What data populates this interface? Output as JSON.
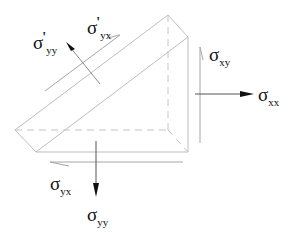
{
  "diagram": {
    "type": "stress-element-wedge",
    "colors": {
      "edge": "#bdbdbd",
      "arrow": "#222222",
      "shear": "#9e9e9e",
      "text": "#111111",
      "background": "#ffffff"
    },
    "labels": {
      "sigma_yy_prime": {
        "symbol": "σ",
        "prime": "'",
        "subscript": "yy"
      },
      "sigma_yx_prime": {
        "symbol": "σ",
        "prime": "'",
        "subscript": "yx"
      },
      "sigma_xy": {
        "symbol": "σ",
        "subscript": "xy"
      },
      "sigma_xx": {
        "symbol": "σ",
        "subscript": "xx"
      },
      "sigma_yx": {
        "symbol": "σ",
        "subscript": "yx"
      },
      "sigma_yy": {
        "symbol": "σ",
        "subscript": "yy"
      }
    }
  }
}
